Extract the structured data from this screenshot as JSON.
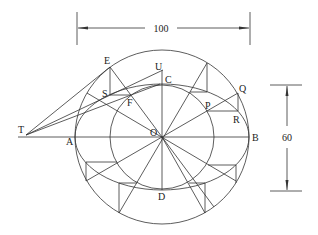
{
  "diagram": {
    "dimensions": {
      "major_axis": "100",
      "minor_axis": "60"
    },
    "points": {
      "E": "E",
      "U": "U",
      "C": "C",
      "S": "S",
      "F": "F",
      "Q": "Q",
      "P": "P",
      "R": "R",
      "T": "T",
      "A": "A",
      "O": "O",
      "B": "B",
      "D": "D"
    }
  }
}
